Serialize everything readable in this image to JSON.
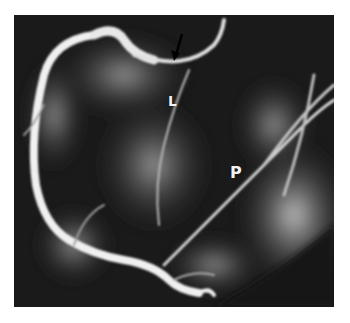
{
  "image": {
    "description": "Coronary angiogram radiograph (grayscale) with annotation labels and an arrow",
    "labels": [
      {
        "id": "L",
        "text": "L"
      },
      {
        "id": "P",
        "text": "P"
      }
    ],
    "annotations": [
      {
        "type": "arrow",
        "direction": "down-left",
        "color": "#000000"
      }
    ],
    "colors": {
      "background": "#1a1a1a",
      "vessel": "#f0f0f0",
      "label": "#f2f2f2",
      "page": "#ffffff"
    }
  }
}
